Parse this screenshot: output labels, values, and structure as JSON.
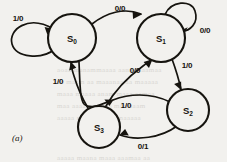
{
  "figure": {
    "caption": "(a)",
    "background_color": "#f2f1ee",
    "ink_color": "#16140f"
  },
  "chart_data": {
    "type": "diagram",
    "diagram_type": "mealy-state-transition-diagram",
    "title": "",
    "nodes": [
      {
        "id": "S0",
        "label": "S",
        "subscript": "0",
        "cx": 72,
        "cy": 38,
        "r": 24
      },
      {
        "id": "S1",
        "label": "S",
        "subscript": "1",
        "cx": 161,
        "cy": 38,
        "r": 24
      },
      {
        "id": "S2",
        "label": "S",
        "subscript": "2",
        "cx": 188,
        "cy": 110,
        "r": 21
      },
      {
        "id": "S3",
        "label": "S",
        "subscript": "3",
        "cx": 99,
        "cy": 127,
        "r": 21
      }
    ],
    "edges": [
      {
        "from": "S0",
        "to": "S0",
        "label": "1/0",
        "kind": "self-loop",
        "label_x": 18,
        "label_y": 21
      },
      {
        "from": "S0",
        "to": "S1",
        "label": "0/0",
        "kind": "arc",
        "label_x": 120,
        "label_y": 11
      },
      {
        "from": "S1",
        "to": "S1",
        "label": "0/0",
        "kind": "self-loop",
        "label_x": 201,
        "label_y": 33
      },
      {
        "from": "S1",
        "to": "S2",
        "label": "1/0",
        "kind": "arc",
        "label_x": 183,
        "label_y": 68
      },
      {
        "from": "S2",
        "to": "S0",
        "label": "1/0",
        "kind": "arc",
        "label_x": 124,
        "label_y": 104
      },
      {
        "from": "S2",
        "to": "S3",
        "label": "0/1",
        "kind": "arc",
        "label_x": 141,
        "label_y": 147
      },
      {
        "from": "S3",
        "to": "S0",
        "label": "1/0",
        "kind": "arc",
        "label_x": 62,
        "label_y": 85
      },
      {
        "from": "S3",
        "to": "S1",
        "label": "0/0",
        "kind": "arc",
        "label_x": 132,
        "label_y": 76
      }
    ]
  },
  "ghost_lines": [
    {
      "text": "aoaa  manammaaaa  aana  aaaamaa",
      "x": 57,
      "y": 66
    },
    {
      "text": "aa  maam  aa  maaanaa  aa  maaaaa",
      "x": 57,
      "y": 78
    },
    {
      "text": "maaa  maaaa  anam  maaa  aamaa",
      "x": 57,
      "y": 90
    },
    {
      "text": "maa  aaaa  maanaa  maa  aaam",
      "x": 57,
      "y": 102
    },
    {
      "text": "aaaaa  maan  aaama  maaaaa",
      "x": 57,
      "y": 114
    },
    {
      "text": "aaaaa  maana  maaa  aaamaa  aa",
      "x": 57,
      "y": 154
    }
  ]
}
